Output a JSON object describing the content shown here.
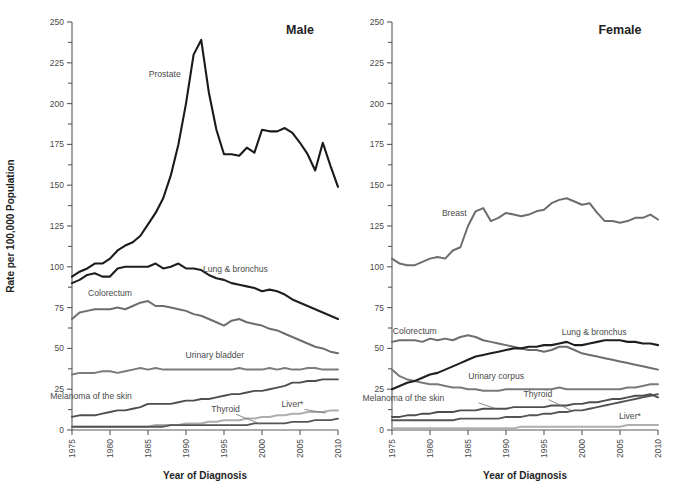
{
  "figure": {
    "width": 677,
    "height": 501,
    "background": "#ffffff",
    "y_axis_title": "Rate per 100,000 Population",
    "x_axis_title": "Year of Diagnosis",
    "panel_male_title": "Male",
    "panel_female_title": "Female"
  },
  "chart_data": [
    {
      "type": "line",
      "title": "Male",
      "xlabel": "Year of Diagnosis",
      "ylabel": "Rate per 100,000 Population",
      "xlim": [
        1975,
        2010
      ],
      "ylim": [
        0,
        250
      ],
      "grid": false,
      "legend": "inline-labels",
      "xticks": [
        1975,
        1980,
        1985,
        1990,
        1995,
        2000,
        2005,
        2010
      ],
      "yticks": [
        0,
        25,
        50,
        75,
        100,
        125,
        150,
        175,
        200,
        225,
        250
      ],
      "yticks_minor": [
        12.5,
        37.5,
        62.5,
        87.5,
        112.5,
        137.5,
        162.5,
        187.5,
        212.5,
        237.5
      ],
      "x": [
        1975,
        1976,
        1977,
        1978,
        1979,
        1980,
        1981,
        1982,
        1983,
        1984,
        1985,
        1986,
        1987,
        1988,
        1989,
        1990,
        1991,
        1992,
        1993,
        1994,
        1995,
        1996,
        1997,
        1998,
        1999,
        2000,
        2001,
        2002,
        2003,
        2004,
        2005,
        2006,
        2007,
        2008,
        2009,
        2010
      ],
      "series": [
        {
          "name": "Prostate",
          "color": "#1a1a1a",
          "width": 2.1,
          "label_x": 1987.2,
          "label_y": 216,
          "values": [
            94,
            97,
            99,
            102,
            102,
            105,
            110,
            113,
            115,
            119,
            126,
            133,
            142,
            156,
            175,
            200,
            230,
            239,
            207,
            184,
            169,
            169,
            168,
            173,
            170,
            184,
            183,
            183,
            185,
            182,
            176,
            169,
            159,
            176,
            162,
            149
          ]
        },
        {
          "name": "Lung & bronchus",
          "color": "#1f1f1f",
          "width": 2.1,
          "label_x": 1996.5,
          "label_y": 97,
          "values": [
            90,
            92,
            95,
            96,
            94,
            94,
            99,
            100,
            100,
            100,
            100,
            102,
            99,
            100,
            102,
            99,
            99,
            98,
            95,
            93,
            92,
            90,
            89,
            88,
            87,
            85,
            86,
            85,
            83,
            80,
            78,
            76,
            74,
            72,
            70,
            68
          ]
        },
        {
          "name": "Colorectum",
          "color": "#6d6d6d",
          "width": 2.0,
          "label_x": 1980.0,
          "label_y": 82,
          "values": [
            68,
            72,
            73,
            74,
            74,
            74,
            75,
            74,
            76,
            78,
            79,
            76,
            76,
            75,
            74,
            73,
            71,
            70,
            68,
            66,
            64,
            67,
            68,
            66,
            65,
            64,
            62,
            61,
            59,
            57,
            55,
            53,
            51,
            50,
            48,
            47
          ]
        },
        {
          "name": "Urinary bladder",
          "color": "#7a7a7a",
          "width": 2.0,
          "label_x": 1993.8,
          "label_y": 44,
          "values": [
            34,
            35,
            35,
            35,
            36,
            36,
            35,
            36,
            37,
            38,
            37,
            38,
            37,
            37,
            37,
            37,
            37,
            37,
            37,
            37,
            37,
            37,
            38,
            37,
            37,
            37,
            38,
            37,
            38,
            37,
            37,
            38,
            38,
            37,
            37,
            37
          ]
        },
        {
          "name": "Melanoma of the skin",
          "color": "#4e4e4e",
          "width": 1.9,
          "label_x": 1977.5,
          "label_y": 19,
          "values": [
            8,
            9,
            9,
            9,
            10,
            11,
            12,
            12,
            13,
            14,
            16,
            16,
            16,
            16,
            17,
            18,
            18,
            19,
            19,
            20,
            21,
            22,
            22,
            23,
            24,
            24,
            25,
            26,
            27,
            29,
            29,
            30,
            30,
            31,
            31,
            31
          ]
        },
        {
          "name": "Thyroid",
          "color": "#555555",
          "width": 1.8,
          "label_x": 1995.2,
          "label_y": 11,
          "values": [
            2,
            2,
            2,
            2,
            2,
            2,
            2,
            2,
            2,
            2,
            2,
            2,
            2,
            3,
            3,
            3,
            3,
            3,
            3,
            3,
            3,
            3,
            3,
            3,
            4,
            4,
            4,
            4,
            4,
            5,
            5,
            5,
            6,
            6,
            6,
            7
          ]
        },
        {
          "name": "Liver*",
          "color": "#aeaeae",
          "width": 2.0,
          "label_x": 2004.0,
          "label_y": 14,
          "values": [
            2,
            2,
            2,
            2,
            2,
            2,
            2,
            2,
            2,
            2,
            2,
            3,
            3,
            3,
            3,
            4,
            4,
            4,
            5,
            5,
            6,
            6,
            6,
            7,
            7,
            8,
            8,
            9,
            9,
            10,
            10,
            11,
            11,
            11,
            12,
            12
          ]
        }
      ]
    },
    {
      "type": "line",
      "title": "Female",
      "xlabel": "Year of Diagnosis",
      "ylabel": "Rate per 100,000 Population",
      "xlim": [
        1975,
        2010
      ],
      "ylim": [
        0,
        250
      ],
      "grid": false,
      "legend": "inline-labels",
      "xticks": [
        1975,
        1980,
        1985,
        1990,
        1995,
        2000,
        2005,
        2010
      ],
      "yticks": [
        0,
        25,
        50,
        75,
        100,
        125,
        150,
        175,
        200,
        225,
        250
      ],
      "yticks_minor": [
        12.5,
        37.5,
        62.5,
        87.5,
        112.5,
        137.5,
        162.5,
        187.5,
        212.5,
        237.5
      ],
      "x": [
        1975,
        1976,
        1977,
        1978,
        1979,
        1980,
        1981,
        1982,
        1983,
        1984,
        1985,
        1986,
        1987,
        1988,
        1989,
        1990,
        1991,
        1992,
        1993,
        1994,
        1995,
        1996,
        1997,
        1998,
        1999,
        2000,
        2001,
        2002,
        2003,
        2004,
        2005,
        2006,
        2007,
        2008,
        2009,
        2010
      ],
      "series": [
        {
          "name": "Breast",
          "color": "#6d6d6d",
          "width": 2.0,
          "label_x": 1983.2,
          "label_y": 131,
          "values": [
            105,
            102,
            101,
            101,
            103,
            105,
            106,
            105,
            110,
            112,
            125,
            134,
            136,
            128,
            130,
            133,
            132,
            131,
            132,
            134,
            135,
            139,
            141,
            142,
            140,
            138,
            139,
            133,
            128,
            128,
            127,
            128,
            130,
            130,
            132,
            129
          ]
        },
        {
          "name": "Lung & bronchus",
          "color": "#1f1f1f",
          "width": 2.1,
          "label_x": 2001.6,
          "label_y": 58,
          "values": [
            25,
            27,
            29,
            30,
            32,
            34,
            35,
            37,
            39,
            41,
            43,
            45,
            46,
            47,
            48,
            49,
            50,
            50,
            51,
            51,
            52,
            52,
            53,
            54,
            52,
            52,
            53,
            54,
            55,
            55,
            55,
            54,
            54,
            53,
            53,
            52
          ]
        },
        {
          "name": "Colorectum",
          "color": "#6d6d6d",
          "width": 2.0,
          "label_x": 1978.0,
          "label_y": 59,
          "values": [
            54,
            55,
            55,
            55,
            54,
            56,
            55,
            56,
            55,
            57,
            58,
            57,
            55,
            54,
            53,
            52,
            51,
            50,
            49,
            49,
            48,
            49,
            51,
            51,
            49,
            47,
            46,
            45,
            44,
            43,
            42,
            41,
            40,
            39,
            38,
            37
          ]
        },
        {
          "name": "Urinary corpus",
          "color": "#7a7a7a",
          "width": 2.0,
          "label_x": 1988.7,
          "label_y": 31,
          "values": [
            37,
            33,
            31,
            30,
            29,
            28,
            28,
            27,
            26,
            26,
            25,
            25,
            24,
            24,
            24,
            25,
            25,
            25,
            25,
            25,
            25,
            25,
            26,
            25,
            25,
            25,
            25,
            25,
            25,
            25,
            25,
            26,
            26,
            27,
            28,
            28
          ]
        },
        {
          "name": "Melanoma of the skin",
          "color": "#4e4e4e",
          "width": 1.9,
          "label_x": 1976.5,
          "label_y": 18,
          "values": [
            8,
            8,
            9,
            9,
            10,
            10,
            11,
            11,
            11,
            12,
            12,
            12,
            13,
            13,
            13,
            13,
            14,
            14,
            14,
            14,
            14,
            15,
            15,
            15,
            16,
            16,
            17,
            17,
            18,
            19,
            19,
            20,
            21,
            21,
            22,
            20
          ]
        },
        {
          "name": "Thyroid",
          "color": "#555555",
          "width": 1.9,
          "label_x": 1994.2,
          "label_y": 20,
          "values": [
            6,
            6,
            6,
            6,
            6,
            6,
            6,
            6,
            6,
            7,
            7,
            7,
            7,
            7,
            7,
            8,
            8,
            8,
            9,
            9,
            10,
            10,
            11,
            11,
            12,
            12,
            13,
            14,
            15,
            16,
            17,
            18,
            19,
            20,
            21,
            22
          ]
        },
        {
          "name": "Liver*",
          "color": "#aeaeae",
          "width": 2.0,
          "label_x": 2006.3,
          "label_y": 7,
          "values": [
            1,
            1,
            1,
            1,
            1,
            1,
            1,
            1,
            1,
            1,
            1,
            1,
            1,
            1,
            1,
            1,
            1,
            2,
            2,
            2,
            2,
            2,
            2,
            2,
            2,
            2,
            2,
            2,
            2,
            2,
            2,
            3,
            3,
            3,
            3,
            3
          ]
        }
      ]
    }
  ]
}
